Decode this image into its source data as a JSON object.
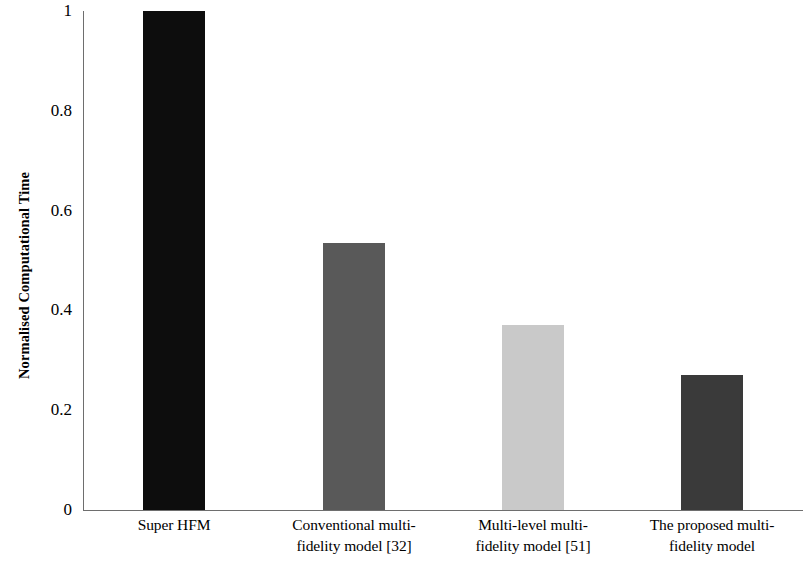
{
  "chart_data": {
    "type": "bar",
    "title": "",
    "subtitle": "",
    "xlabel": "",
    "ylabel": "Normalised Computational Time",
    "categories": [
      "Super HFM",
      "Conventional multi-fidelity model [32]",
      "Multi-level multi-fidelity model [51]",
      "The proposed multi-fidelity model"
    ],
    "category_lines": [
      [
        "Super HFM"
      ],
      [
        "Conventional multi-",
        "fidelity model [32]"
      ],
      [
        "Multi-level multi-",
        "fidelity model [51]"
      ],
      [
        "The proposed multi-",
        "fidelity model"
      ]
    ],
    "values": [
      1.0,
      0.535,
      0.37,
      0.27
    ],
    "bar_colors": [
      "#0d0d0d",
      "#595959",
      "#c9c9c9",
      "#3a3a3a"
    ],
    "ylim": [
      0,
      1
    ],
    "ytick_values": [
      1,
      0.8,
      0.6,
      0.4,
      0.2,
      0
    ],
    "ytick_labels": [
      "1",
      "0.8",
      "0.6",
      "0.4",
      "0.2",
      "0"
    ],
    "grid": false,
    "legend": false,
    "legend_position": "none",
    "axis_color": "#6e6e6e",
    "background_color": "#ffffff",
    "bar_width_px": 62,
    "category_centers_px": [
      174,
      354,
      533,
      712
    ]
  }
}
